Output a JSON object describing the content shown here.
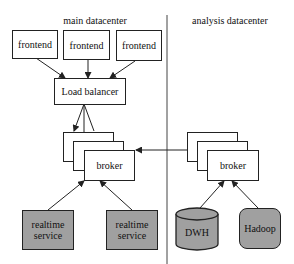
{
  "regions": {
    "main": {
      "label": "main datacenter"
    },
    "analysis": {
      "label": "analysis datacenter"
    }
  },
  "nodes": {
    "frontends": [
      {
        "label": "frontend"
      },
      {
        "label": "frontend"
      },
      {
        "label": "frontend"
      }
    ],
    "load_balancer": {
      "label": "Load balancer"
    },
    "main_broker": {
      "label": "broker"
    },
    "realtime_services": [
      {
        "label": "realtime service"
      },
      {
        "label": "realtime service"
      }
    ],
    "analysis_broker": {
      "label": "broker"
    },
    "dwh": {
      "label": "DWH"
    },
    "hadoop": {
      "label": "Hadoop"
    }
  },
  "colors": {
    "stroke": "#222222",
    "fill_grey": "#a0a0a0",
    "background": "#ffffff"
  }
}
